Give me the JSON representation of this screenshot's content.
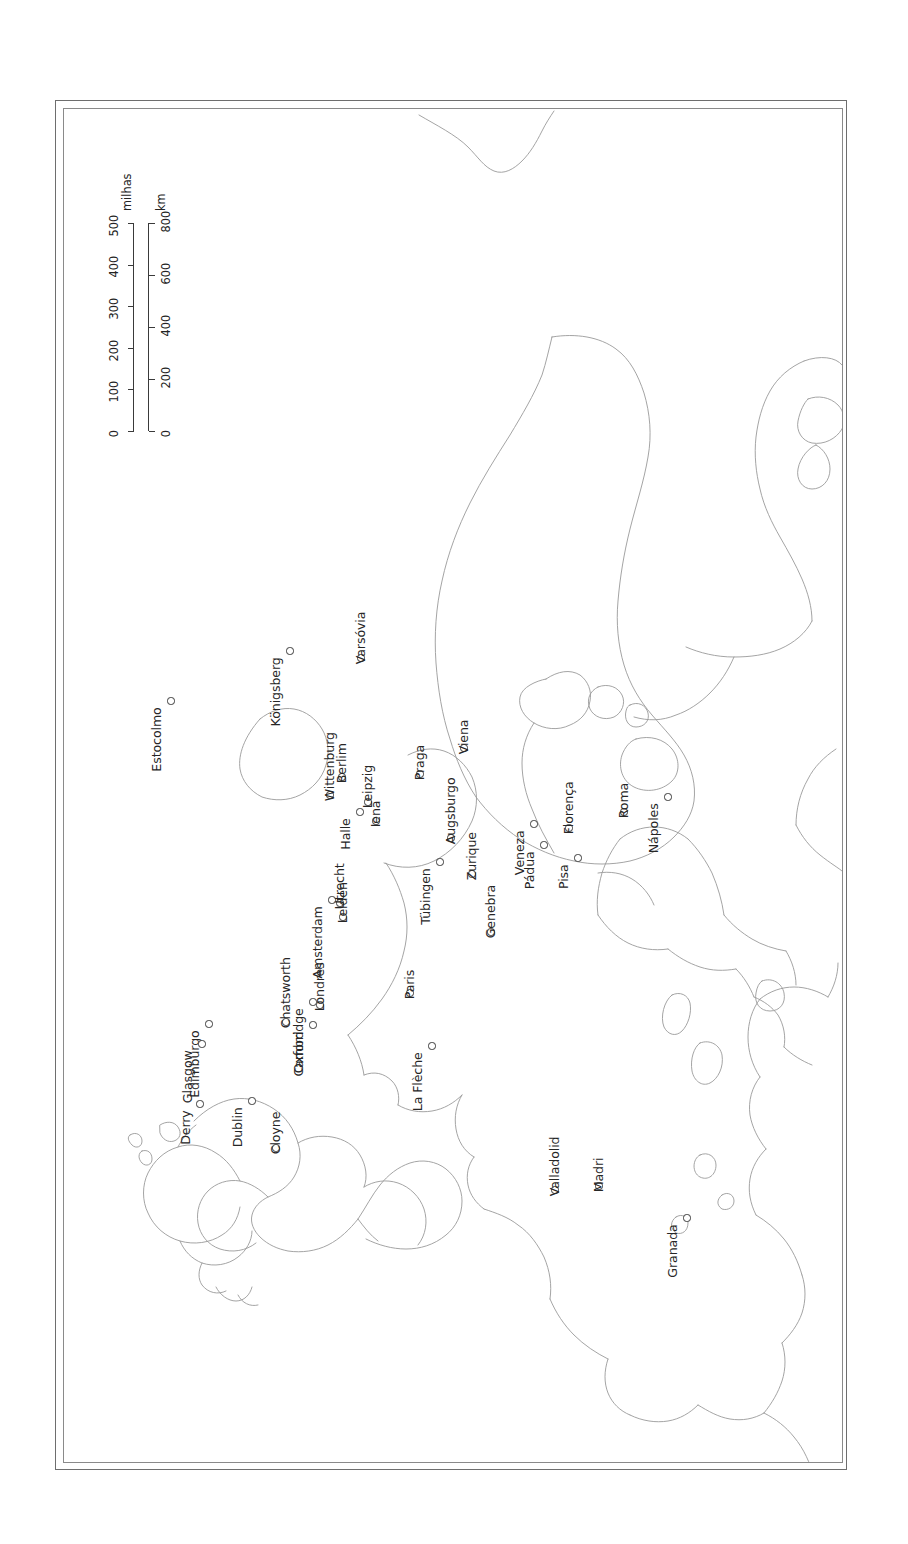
{
  "map": {
    "title": "Mapa da Europa",
    "orientation": "rotated-90-ccw",
    "frame": {
      "style": "double-line",
      "color": "#6e6e6e"
    },
    "scale_bar": {
      "miles": {
        "unit_label": "milhas",
        "ticks": [
          "0",
          "100",
          "200",
          "300",
          "400",
          "500"
        ]
      },
      "km": {
        "unit_label": "km",
        "ticks": [
          "0",
          "200",
          "400",
          "600",
          "800"
        ]
      }
    },
    "cities": [
      {
        "name": "Estocolmo",
        "x": 171,
        "y": 701,
        "side": "before"
      },
      {
        "name": "Königsberg",
        "x": 290,
        "y": 651,
        "side": "before"
      },
      {
        "name": "Varsóvia",
        "x": 361,
        "y": 658,
        "side": "after"
      },
      {
        "name": "Wittenburg",
        "x": 330,
        "y": 795,
        "side": "after"
      },
      {
        "name": "Berlim",
        "x": 342,
        "y": 777,
        "side": "after"
      },
      {
        "name": "Halle",
        "x": 360,
        "y": 812,
        "side": "before"
      },
      {
        "name": "Leipzig",
        "x": 368,
        "y": 802,
        "side": "after"
      },
      {
        "name": "Iena",
        "x": 376,
        "y": 821,
        "side": "after"
      },
      {
        "name": "Praga",
        "x": 420,
        "y": 774,
        "side": "after"
      },
      {
        "name": "Viena",
        "x": 464,
        "y": 748,
        "side": "after"
      },
      {
        "name": "Augsburgo",
        "x": 451,
        "y": 838,
        "side": "after"
      },
      {
        "name": "Tübingen",
        "x": 440,
        "y": 862,
        "side": "before"
      },
      {
        "name": "Zurique",
        "x": 472,
        "y": 874,
        "side": "after"
      },
      {
        "name": "Genebra",
        "x": 491,
        "y": 932,
        "side": "after"
      },
      {
        "name": "Amsterdam",
        "x": 332,
        "y": 900,
        "side": "before"
      },
      {
        "name": "Utrecht",
        "x": 340,
        "y": 903,
        "side": "after"
      },
      {
        "name": "Leiden",
        "x": 343,
        "y": 917,
        "side": "after"
      },
      {
        "name": "Veneza",
        "x": 534,
        "y": 824,
        "side": "before"
      },
      {
        "name": "Pádua",
        "x": 544,
        "y": 845,
        "side": "before"
      },
      {
        "name": "Florença",
        "x": 569,
        "y": 828,
        "side": "after"
      },
      {
        "name": "Pisa",
        "x": 578,
        "y": 858,
        "side": "before"
      },
      {
        "name": "Roma",
        "x": 624,
        "y": 812,
        "side": "after"
      },
      {
        "name": "Nápoles",
        "x": 668,
        "y": 797,
        "side": "before"
      },
      {
        "name": "Paris",
        "x": 410,
        "y": 993,
        "side": "after"
      },
      {
        "name": "La Flèche",
        "x": 432,
        "y": 1046,
        "side": "before"
      },
      {
        "name": "Londres",
        "x": 320,
        "y": 1005,
        "side": "after"
      },
      {
        "name": "Oxford",
        "x": 313,
        "y": 1025,
        "side": "before"
      },
      {
        "name": "Cambridge",
        "x": 313,
        "y": 1002,
        "side": "before"
      },
      {
        "name": "Chatsworth",
        "x": 286,
        "y": 1022,
        "side": "after"
      },
      {
        "name": "Edimburgo",
        "x": 209,
        "y": 1024,
        "side": "before"
      },
      {
        "name": "Glasgow",
        "x": 202,
        "y": 1044,
        "side": "before"
      },
      {
        "name": "Derry",
        "x": 200,
        "y": 1104,
        "side": "before"
      },
      {
        "name": "Dublin",
        "x": 252,
        "y": 1101,
        "side": "before"
      },
      {
        "name": "Cloyne",
        "x": 276,
        "y": 1148,
        "side": "after"
      },
      {
        "name": "Valladolid",
        "x": 555,
        "y": 1190,
        "side": "after"
      },
      {
        "name": "Madri",
        "x": 599,
        "y": 1186,
        "side": "after"
      },
      {
        "name": "Granada",
        "x": 687,
        "y": 1218,
        "side": "before"
      }
    ]
  }
}
